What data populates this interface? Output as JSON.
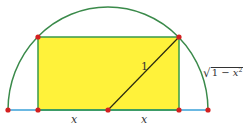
{
  "diagram": {
    "colors": {
      "arc": "#3a8a4a",
      "baseline": "#3aa0d8",
      "rect_fill": "#fff23a",
      "rect_stroke": "#3a9a4a",
      "radius_line": "#2a2a10",
      "points": "#d42020"
    },
    "labels": {
      "radius": "1",
      "height_sqrt": "√",
      "height_radicand_prefix": "1 − ",
      "height_var": "x",
      "height_exp": "2",
      "left_half_width": "x",
      "right_half_width": "x"
    },
    "points": [
      {
        "name": "left-end",
        "x": 8,
        "y": 110
      },
      {
        "name": "rect-bottom-left",
        "x": 38,
        "y": 110
      },
      {
        "name": "center",
        "x": 108,
        "y": 110
      },
      {
        "name": "rect-bottom-right",
        "x": 179,
        "y": 110
      },
      {
        "name": "right-end",
        "x": 208,
        "y": 110
      },
      {
        "name": "rect-top-left",
        "x": 38,
        "y": 37
      },
      {
        "name": "rect-top-right",
        "x": 179,
        "y": 37
      }
    ]
  }
}
